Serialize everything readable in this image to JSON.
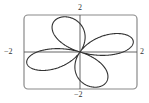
{
  "chart_data": {
    "type": "line",
    "title": "",
    "xlabel": "",
    "ylabel": "",
    "xlim": [
      -2,
      2
    ],
    "ylim": [
      -2,
      2
    ],
    "grid": false,
    "legend": null,
    "tick_labels": {
      "x_min": "−2",
      "x_max": "2",
      "y_min": "−2",
      "y_max": "2"
    },
    "series": [
      {
        "name": "four-petal rose curve (polar)",
        "description": "Four-leaved rose centered at origin; petal tips approximately at angles 20°, 110°, 200°, 290° with length ~2",
        "petal_tips": [
          {
            "x": 1.8,
            "y": 0.85
          },
          {
            "x": -0.8,
            "y": 1.9
          },
          {
            "x": -1.85,
            "y": -0.85
          },
          {
            "x": 0.85,
            "y": -1.8
          }
        ],
        "petal_length": 2,
        "rotation_deg": 20,
        "color": "#333333"
      }
    ]
  },
  "labels": {
    "y_max": "2",
    "y_min": "−2",
    "x_min": "−2",
    "x_max": "2"
  },
  "colors": {
    "curve": "#333333",
    "frame": "#888888",
    "axes": "#555555"
  }
}
